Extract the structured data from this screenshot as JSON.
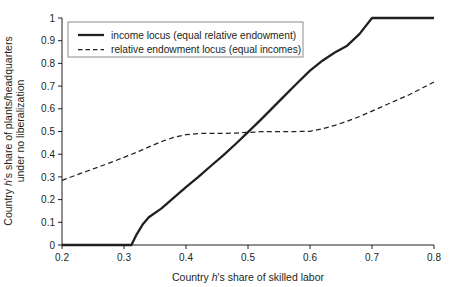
{
  "chart_data": {
    "type": "line",
    "title": "",
    "xlabel": "Country h's share of skilled labor",
    "ylabel": "Country h's share of plants/headquarters under no liberalization",
    "ylabel_line1": "Country h's share of plants/headquarters",
    "ylabel_line2": "under no liberalization",
    "xlabel_prefix": "Country ",
    "xlabel_italic": "h",
    "xlabel_suffix": "'s share of skilled labor",
    "ylabel1_prefix": "Country ",
    "ylabel1_italic": "h",
    "ylabel1_suffix": "'s share of plants/headquarters",
    "xlim": [
      0.2,
      0.8
    ],
    "ylim": [
      0,
      1
    ],
    "xticks": [
      0.2,
      0.3,
      0.4,
      0.5,
      0.6,
      0.7,
      0.8
    ],
    "xtick_labels": [
      "0.2",
      "0.3",
      "0.4",
      "0.5",
      "0.6",
      "0.7",
      "0.8"
    ],
    "yticks": [
      0,
      0.1,
      0.2,
      0.3,
      0.4,
      0.5,
      0.6,
      0.7,
      0.8,
      0.9,
      1
    ],
    "ytick_labels": [
      "0",
      "0.1",
      "0.2",
      "0.3",
      "0.4",
      "0.5",
      "0.6",
      "0.7",
      "0.8",
      "0.9",
      "1"
    ],
    "grid": false,
    "legend_position": "upper-left-inside",
    "line_color": "#231f20",
    "series": [
      {
        "name": "income locus (equal relative endowment)",
        "style": "solid",
        "x": [
          0.2,
          0.24,
          0.28,
          0.312,
          0.32,
          0.33,
          0.34,
          0.36,
          0.38,
          0.4,
          0.42,
          0.44,
          0.46,
          0.48,
          0.5,
          0.52,
          0.54,
          0.56,
          0.58,
          0.6,
          0.62,
          0.64,
          0.66,
          0.68,
          0.7,
          0.74,
          0.78,
          0.8
        ],
        "y": [
          0.0,
          0.0,
          0.0,
          0.0,
          0.045,
          0.09,
          0.122,
          0.16,
          0.208,
          0.255,
          0.3,
          0.348,
          0.395,
          0.445,
          0.497,
          0.55,
          0.605,
          0.66,
          0.715,
          0.768,
          0.812,
          0.848,
          0.878,
          0.93,
          1.0,
          1.0,
          1.0,
          1.0
        ]
      },
      {
        "name": "relative endowment locus (equal incomes)",
        "style": "dashed",
        "x": [
          0.2,
          0.22,
          0.24,
          0.26,
          0.28,
          0.3,
          0.32,
          0.34,
          0.36,
          0.38,
          0.4,
          0.42,
          0.44,
          0.46,
          0.48,
          0.5,
          0.52,
          0.54,
          0.56,
          0.58,
          0.6,
          0.62,
          0.64,
          0.66,
          0.68,
          0.7,
          0.72,
          0.74,
          0.76,
          0.78,
          0.8
        ],
        "y": [
          0.285,
          0.305,
          0.325,
          0.345,
          0.365,
          0.386,
          0.408,
          0.432,
          0.455,
          0.474,
          0.486,
          0.491,
          0.492,
          0.492,
          0.493,
          0.496,
          0.499,
          0.5,
          0.5,
          0.5,
          0.501,
          0.512,
          0.527,
          0.545,
          0.566,
          0.59,
          0.614,
          0.638,
          0.662,
          0.69,
          0.718
        ]
      }
    ],
    "legend": [
      {
        "label": "income locus (equal relative endowment)",
        "style": "solid"
      },
      {
        "label": "relative endowment locus (equal incomes)",
        "style": "dashed"
      }
    ]
  }
}
